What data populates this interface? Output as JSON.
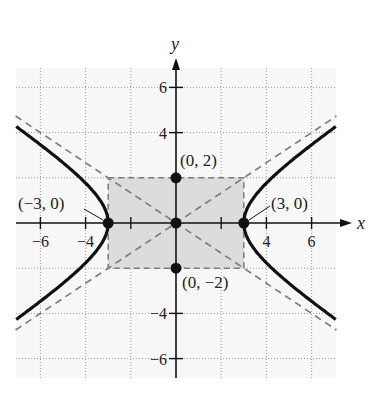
{
  "chart_data": {
    "type": "line",
    "title": "",
    "xlabel": "x",
    "ylabel": "y",
    "xlim": [
      -7,
      7
    ],
    "ylim": [
      -7,
      7
    ],
    "grid": true,
    "grid_step": 2,
    "x_ticks": [
      -6,
      -4,
      4,
      6
    ],
    "x_tick_labels": [
      "−6",
      "−4",
      "4",
      "6"
    ],
    "y_ticks": [
      6,
      4,
      -4,
      -6
    ],
    "y_tick_labels": [
      "6",
      "4",
      "−4",
      "−6"
    ],
    "curve": {
      "name": "hyperbola",
      "equation": "x^2/9 - y^2/4 = 1",
      "a": 3,
      "b": 2,
      "style": "solid bold black"
    },
    "asymptotes": [
      {
        "name": "y = (2/3)x",
        "slope": 0.6667,
        "style": "dashed gray"
      },
      {
        "name": "y = -(2/3)x",
        "slope": -0.6667,
        "style": "dashed gray"
      }
    ],
    "fundamental_rectangle": {
      "x": [
        -3,
        3
      ],
      "y": [
        -2,
        2
      ],
      "fill": "#dcdcdc",
      "style": "dashed gray border"
    },
    "points": [
      {
        "x": -3,
        "y": 0,
        "label": "(−3, 0)"
      },
      {
        "x": 3,
        "y": 0,
        "label": "(3, 0)"
      },
      {
        "x": 0,
        "y": 2,
        "label": "(0, 2)"
      },
      {
        "x": 0,
        "y": -2,
        "label": "(0, −2)"
      },
      {
        "x": 0,
        "y": 0,
        "label": ""
      }
    ]
  },
  "colors": {
    "grid_bg": "#f7f7f7",
    "grid_line": "#9a9a9a",
    "rect_fill": "#dcdcdc",
    "dash": "#7a7a7a",
    "curve": "#111111"
  }
}
